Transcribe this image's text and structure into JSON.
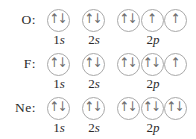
{
  "diagram": {
    "icons": {
      "up": "↑",
      "down": "↓"
    },
    "colors": {
      "background": "#ffffff",
      "circle_stroke": "#a9a9a9",
      "arrow": "#6e6e6e",
      "text": "#2b2b2b"
    },
    "rows": [
      {
        "element": "O:",
        "groups": [
          {
            "name": "1s",
            "label": {
              "num": "1",
              "letter": "s"
            },
            "circles": [
              [
                "up",
                "down"
              ]
            ]
          },
          {
            "name": "2s",
            "label": {
              "num": "2",
              "letter": "s"
            },
            "circles": [
              [
                "up",
                "down"
              ]
            ]
          },
          {
            "name": "2p",
            "label": {
              "num": "2",
              "letter": "p"
            },
            "circles": [
              [
                "up",
                "down"
              ],
              [
                "up"
              ],
              [
                "up"
              ]
            ]
          }
        ]
      },
      {
        "element": "F:",
        "groups": [
          {
            "name": "1s",
            "label": {
              "num": "1",
              "letter": "s"
            },
            "circles": [
              [
                "up",
                "down"
              ]
            ]
          },
          {
            "name": "2s",
            "label": {
              "num": "2",
              "letter": "s"
            },
            "circles": [
              [
                "up",
                "down"
              ]
            ]
          },
          {
            "name": "2p",
            "label": {
              "num": "2",
              "letter": "p"
            },
            "circles": [
              [
                "up",
                "down"
              ],
              [
                "up",
                "down"
              ],
              [
                "up"
              ]
            ]
          }
        ]
      },
      {
        "element": "Ne:",
        "groups": [
          {
            "name": "1s",
            "label": {
              "num": "1",
              "letter": "s"
            },
            "circles": [
              [
                "up",
                "down"
              ]
            ]
          },
          {
            "name": "2s",
            "label": {
              "num": "2",
              "letter": "s"
            },
            "circles": [
              [
                "up",
                "down"
              ]
            ]
          },
          {
            "name": "2p",
            "label": {
              "num": "2",
              "letter": "p"
            },
            "circles": [
              [
                "up",
                "down"
              ],
              [
                "up",
                "down"
              ],
              [
                "up",
                "down"
              ]
            ]
          }
        ]
      }
    ]
  }
}
